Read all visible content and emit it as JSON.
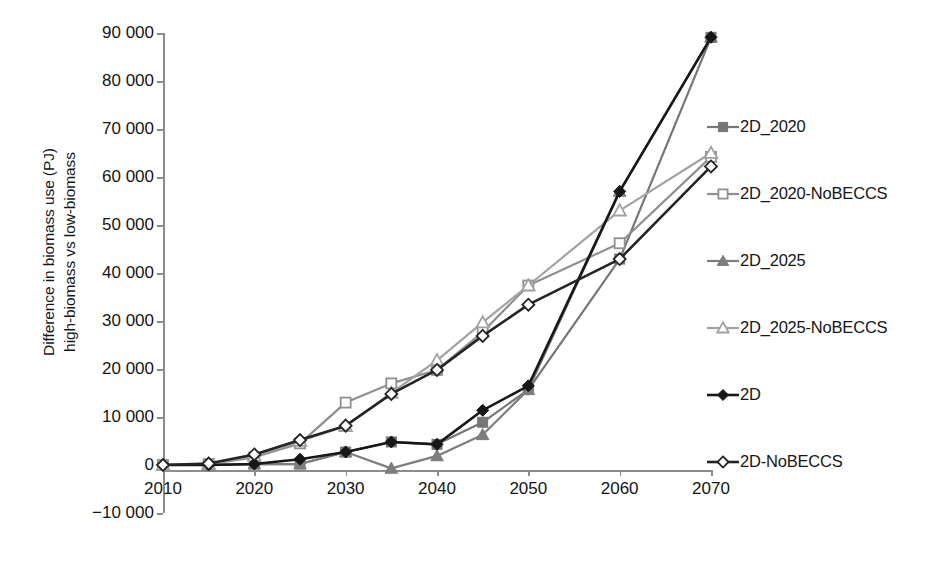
{
  "chart_data": {
    "type": "line",
    "title": "",
    "xlabel": "",
    "ylabel": "Difference in biomass use (PJ)\nhigh-biomass vs low-biomass",
    "x": [
      2010,
      2015,
      2020,
      2025,
      2030,
      2035,
      2040,
      2045,
      2050,
      2060,
      2070
    ],
    "xlim": [
      2010,
      2070
    ],
    "ylim": [
      -10000,
      90000
    ],
    "xticks": [
      2010,
      2020,
      2030,
      2040,
      2050,
      2060,
      2070
    ],
    "xtick_labels": [
      "2010",
      "2020",
      "2030",
      "2040",
      "2050",
      "2060",
      "2070"
    ],
    "yticks": [
      -10000,
      0,
      10000,
      20000,
      30000,
      40000,
      50000,
      60000,
      70000,
      80000,
      90000
    ],
    "ytick_labels": [
      "−10 000",
      "0",
      "10 000",
      "20 000",
      "30 000",
      "40 000",
      "50 000",
      "60 000",
      "70 000",
      "80 000",
      "90 000"
    ],
    "grid": false,
    "legend_position": "right",
    "series": [
      {
        "name": "2D_2020",
        "color": "#767676",
        "marker": "square-filled",
        "values": [
          0,
          0,
          200,
          200,
          2700,
          4800,
          4300,
          8900,
          15700,
          42900,
          89100
        ]
      },
      {
        "name": "2D_2020-NoBECCS",
        "color": "#8f8f8f",
        "marker": "square-open",
        "values": [
          0,
          200,
          1600,
          4500,
          13000,
          17000,
          19800,
          27700,
          37400,
          46200,
          64200
        ]
      },
      {
        "name": "2D_2025",
        "color": "#7d7d7d",
        "marker": "triangle-filled",
        "values": [
          0,
          0,
          200,
          200,
          2700,
          -700,
          1900,
          6300,
          15700,
          57000,
          89100
        ]
      },
      {
        "name": "2D_2025-NoBECCS",
        "color": "#a2a2a2",
        "marker": "triangle-open",
        "values": [
          0,
          200,
          1900,
          5000,
          8100,
          15000,
          21800,
          29700,
          37400,
          53000,
          65000
        ]
      },
      {
        "name": "2D",
        "color": "#171717",
        "marker": "diamond-filled",
        "values": [
          0,
          0,
          200,
          1200,
          2700,
          4800,
          4300,
          11400,
          16500,
          57000,
          89100
        ]
      },
      {
        "name": "2D-NoBECCS",
        "color": "#242424",
        "marker": "diamond-open",
        "values": [
          0,
          300,
          2200,
          5200,
          8200,
          14800,
          19800,
          26900,
          33400,
          42900,
          62200
        ]
      }
    ]
  },
  "legend": {
    "items": [
      {
        "label": "2D_2020"
      },
      {
        "label": "2D_2020-NoBECCS"
      },
      {
        "label": "2D_2025"
      },
      {
        "label": "2D_2025-NoBECCS"
      },
      {
        "label": "2D"
      },
      {
        "label": "2D-NoBECCS"
      }
    ]
  }
}
